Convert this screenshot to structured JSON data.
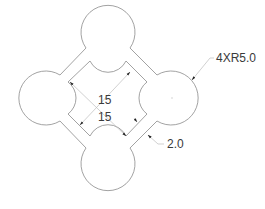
{
  "diagram": {
    "type": "technical-drawing",
    "stroke_color": "#8a8a8a",
    "dim_color": "#c8c8c8",
    "arrow_color": "#222222",
    "text_color": "#3a3a3a"
  },
  "shapes": {
    "circles": [
      {
        "name": "top",
        "cx": 108,
        "cy": 32,
        "r": 27
      },
      {
        "name": "left",
        "cx": 45,
        "cy": 98,
        "r": 27
      },
      {
        "name": "right",
        "cx": 172,
        "cy": 98,
        "r": 27
      },
      {
        "name": "bottom",
        "cx": 108,
        "cy": 164,
        "r": 27
      }
    ]
  },
  "dimensions": {
    "diag1": {
      "label": "15"
    },
    "diag2": {
      "label": "15"
    },
    "radius": {
      "label": "4XR5.0"
    },
    "wall": {
      "label": "2.0"
    }
  }
}
